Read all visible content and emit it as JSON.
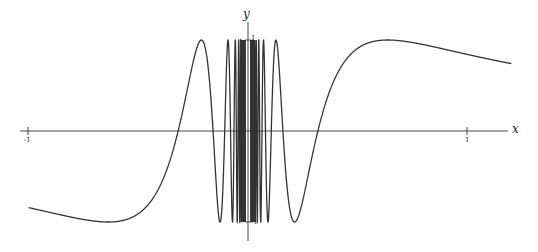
{
  "chart_data": {
    "type": "line",
    "title": "",
    "function": "y = sin(1/x)",
    "xlabel": "x",
    "ylabel": "y",
    "xlim": [
      -1.05,
      1.22
    ],
    "ylim": [
      -1.3,
      1.3
    ],
    "x_ticks": [
      -1,
      1
    ],
    "x_tick_labels": [
      "-1",
      "1"
    ],
    "y_ticks": [
      1,
      -1
    ],
    "y_tick_labels": [
      "1",
      "-1"
    ],
    "grid": false,
    "legend": null,
    "series": [
      {
        "name": "sin(1/x)",
        "domain": [
          -1,
          1.2
        ],
        "color": "#333333"
      }
    ],
    "sample_points": {
      "x": [
        -1,
        -0.637,
        -0.318,
        -0.212,
        0,
        0.212,
        0.318,
        0.637,
        1,
        1.2
      ],
      "y": [
        -0.84,
        -1,
        0,
        1,
        null,
        -1,
        0,
        1,
        0.84,
        0.67
      ]
    }
  },
  "axes": {
    "x_label": "x",
    "y_label": "y",
    "x_tick_neg": "-1",
    "x_tick_pos": "1",
    "y_tick_top": "1",
    "y_tick_bottom": "-1"
  },
  "colors": {
    "curve": "#333333",
    "axis": "#444444",
    "background": "#ffffff"
  }
}
